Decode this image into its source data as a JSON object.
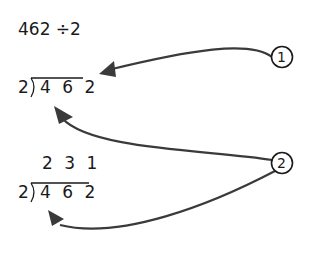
{
  "problem": {
    "expression": "462 ÷2"
  },
  "step1": {
    "divisor": "2",
    "dividend": "4 6 2"
  },
  "step2": {
    "quotient": "2 3 1",
    "divisor": "2",
    "dividend": "4 6 2"
  },
  "markers": [
    {
      "label": "1"
    },
    {
      "label": "2"
    }
  ],
  "colors": {
    "ink": "#1a1a1a",
    "arrow": "#3a3a3a"
  }
}
